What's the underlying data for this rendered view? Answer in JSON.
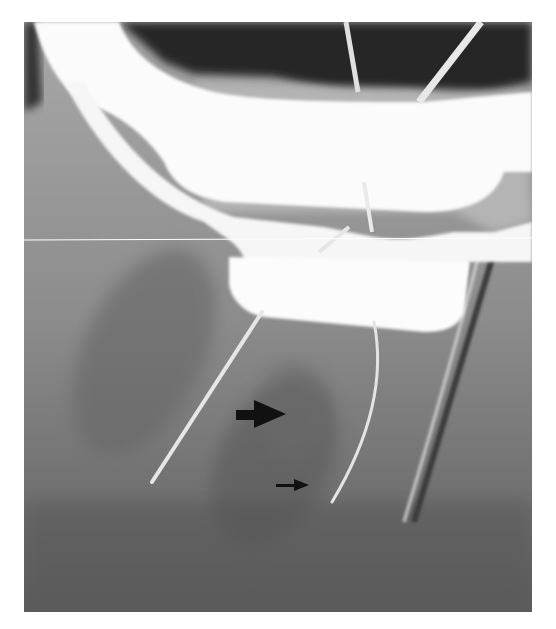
{
  "image": {
    "type": "dental periapical radiograph",
    "description": "Radiograph of a mandibular molar with a rubber dam clamp and endodontic files in the root canals; two black arrows mark a region between the roots.",
    "annotations": [
      {
        "name": "large-arrow",
        "direction": "right"
      },
      {
        "name": "small-arrow",
        "direction": "right"
      }
    ],
    "colors": {
      "background": "#ffffff",
      "film_dark": "#2a2a2a",
      "bone_gray": "#8e8e8e",
      "clamp_white": "#fbfbfb",
      "arrow": "#111111"
    }
  }
}
